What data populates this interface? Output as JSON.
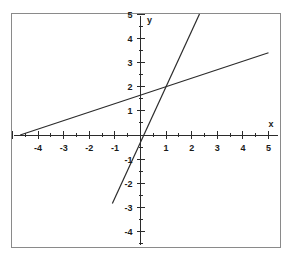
{
  "chart_data": {
    "type": "line",
    "title": "",
    "xlabel": "x",
    "ylabel": "y",
    "xlim": [
      -5,
      5
    ],
    "ylim": [
      -5,
      5
    ],
    "grid": false,
    "legend": "none",
    "x_tick_labels": [
      "-4",
      "-3",
      "-2",
      "-1",
      "1",
      "2",
      "3",
      "4",
      "5"
    ],
    "x_tick_values": [
      -4,
      -3,
      -2,
      -1,
      1,
      2,
      3,
      4,
      5
    ],
    "y_tick_labels": [
      "5",
      "4",
      "3",
      "2",
      "1",
      "-1",
      "-2",
      "-3",
      "-4"
    ],
    "y_tick_values": [
      5,
      4,
      3,
      2,
      1,
      -1,
      -2,
      -3,
      -4
    ],
    "minor_tick_step": 0.5,
    "series": [
      {
        "name": "shallow-line",
        "slope": 0.35,
        "intercept": 1.65,
        "x": [
          -4.7,
          5.0
        ],
        "y": [
          0.0,
          3.4
        ]
      },
      {
        "name": "steep-line",
        "slope": 2.3,
        "intercept": -0.3,
        "x": [
          -1.1,
          2.5
        ],
        "y": [
          -2.83,
          5.45
        ]
      }
    ],
    "intersection": {
      "x": 1,
      "y": 2
    }
  },
  "axes": {
    "x_axis_label": "x",
    "y_axis_label": "y"
  },
  "ticks": {
    "x": [
      {
        "label": "-4",
        "value": -4
      },
      {
        "label": "-3",
        "value": -3
      },
      {
        "label": "-2",
        "value": -2
      },
      {
        "label": "-1",
        "value": -1
      },
      {
        "label": "1",
        "value": 1
      },
      {
        "label": "2",
        "value": 2
      },
      {
        "label": "3",
        "value": 3
      },
      {
        "label": "4",
        "value": 4
      },
      {
        "label": "5",
        "value": 5
      }
    ],
    "y": [
      {
        "label": "5",
        "value": 5
      },
      {
        "label": "4",
        "value": 4
      },
      {
        "label": "3",
        "value": 3
      },
      {
        "label": "2",
        "value": 2
      },
      {
        "label": "1",
        "value": 1
      },
      {
        "label": "-1",
        "value": -1
      },
      {
        "label": "-2",
        "value": -2
      },
      {
        "label": "-3",
        "value": -3
      },
      {
        "label": "-4",
        "value": -4
      }
    ]
  },
  "colors": {
    "line": "#2b2b2b",
    "axis": "#2b2b2b",
    "frame": "#8a8a8a",
    "background": "#ffffff",
    "text": "#1a1a1a"
  }
}
